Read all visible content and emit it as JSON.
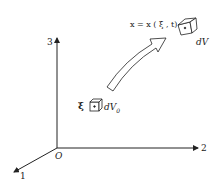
{
  "axes": {
    "x1_label": "1",
    "x2_label": "2",
    "x3_label": "3",
    "origin_label": "O"
  },
  "reference": {
    "point_label": "ξ",
    "volume_label": "dV",
    "volume_sub": "0"
  },
  "current": {
    "map_label": "x = x ( ξ , t)",
    "volume_label": "dV"
  },
  "colors": {
    "ink": "#222222",
    "background": "#ffffff"
  }
}
